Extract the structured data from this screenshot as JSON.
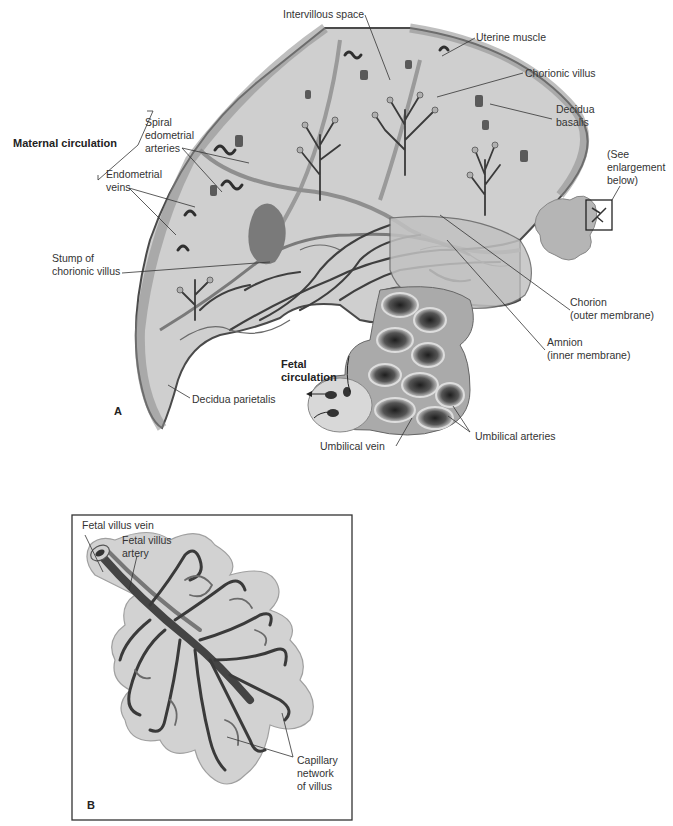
{
  "figure": {
    "panel_a": {
      "letter": "A",
      "labels": {
        "intervillous_space": "Intervillous space",
        "uterine_muscle": "Uterine muscle",
        "chorionic_villus": "Chorionic villus",
        "decidua_basalis": "Decidua\nbasalis",
        "see_enlargement": "(See\nenlargement\nbelow)",
        "maternal_circulation": "Maternal circulation",
        "spiral_arteries": "Spiral\nedometrial\narteries",
        "endometrial_veins": "Endometrial\nveins",
        "stump_villus": "Stump of\nchorionic villus",
        "chorion": "Chorion\n(outer membrane)",
        "amnion": "Amnion\n(inner membrane)",
        "fetal_circulation": "Fetal\ncirculation",
        "decidua_parietalis": "Decidua parietalis",
        "umbilical_vein": "Umbilical vein",
        "umbilical_arteries": "Umbilical arteries"
      }
    },
    "panel_b": {
      "letter": "B",
      "labels": {
        "fetal_villus_vein": "Fetal villus vein",
        "fetal_villus_artery": "Fetal villus\nartery",
        "capillary_network": "Capillary\nnetwork\nof villus"
      }
    },
    "colors": {
      "tissue_light": "#d4d4d4",
      "tissue_mid": "#b8b8b8",
      "vessel_dark": "#3a3a3a",
      "outline": "#555555",
      "box_border": "#333333"
    }
  }
}
